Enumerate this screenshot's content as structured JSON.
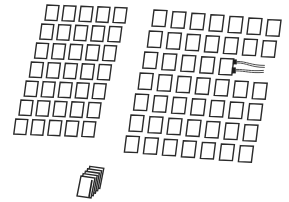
{
  "diagram": {
    "colors": {
      "stroke": "#2a2a2a",
      "background": "#ffffff",
      "plug": "#1e1e1e"
    },
    "left_grid": {
      "rows": 7,
      "cols": 5,
      "origin": [
        45,
        5
      ],
      "card_size": [
        12,
        15
      ],
      "col_step": [
        17,
        0.6
      ],
      "row_step": [
        -5.2,
        19
      ],
      "row_counts": [
        5,
        5,
        5,
        5,
        5,
        5,
        5
      ]
    },
    "right_grid": {
      "rows": 7,
      "cols": 7,
      "origin": [
        152,
        10
      ],
      "card_size": [
        13,
        16
      ],
      "col_step": [
        19,
        1.6
      ],
      "row_step": [
        -4.6,
        21
      ],
      "row_counts": [
        7,
        7,
        5,
        7,
        7,
        7,
        7
      ]
    },
    "connected_card": {
      "grid": "right",
      "row": 2,
      "col": 4,
      "cables": 2,
      "icon": "cable-plug-icon"
    },
    "card_stack": {
      "icon": "card-stack-icon",
      "count": 5,
      "origin": [
        77,
        176
      ],
      "card_size": [
        14,
        20
      ]
    }
  }
}
